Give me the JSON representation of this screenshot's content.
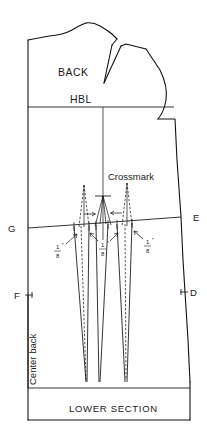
{
  "drawing": {
    "type": "sewing-pattern-draft",
    "piece": "back bodice block",
    "labels": {
      "back": "BACK",
      "hbl": "HBL",
      "crossmark": "Crossmark",
      "center_back": "Center back",
      "lower_section": "LOWER SECTION"
    },
    "points": [
      {
        "id": "G",
        "label": "G",
        "side": "left",
        "x": 10,
        "y": 228
      },
      {
        "id": "E",
        "label": "E",
        "side": "right",
        "x": 193,
        "y": 217
      },
      {
        "id": "F",
        "label": "F",
        "side": "left",
        "x": 18,
        "y": 295
      },
      {
        "id": "D",
        "label": "D",
        "side": "right",
        "x": 185,
        "y": 292
      }
    ],
    "measurements": [
      {
        "id": "dart-left",
        "numerator": "1",
        "denominator": "8",
        "unit": "″",
        "x": 56,
        "y": 248
      },
      {
        "id": "dart-center",
        "numerator": "1",
        "denominator": "8",
        "unit": "″",
        "x": 101,
        "y": 246
      },
      {
        "id": "dart-right",
        "numerator": "1",
        "denominator": "8",
        "unit": "″",
        "x": 146,
        "y": 243
      }
    ],
    "colors": {
      "ink": "#111111",
      "paper": "#ffffff"
    }
  }
}
